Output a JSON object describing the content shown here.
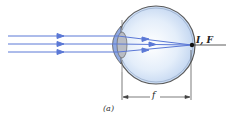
{
  "diagram": {
    "type": "eye-optics",
    "focus_label": "I, F",
    "focal_length_label": "f",
    "caption": "(a)",
    "ray_count": 3,
    "colors": {
      "ray": "#5b78d6",
      "eye_fill": "#cfe0f5",
      "eye_outline": "#555555",
      "lens": "#b8bcc4"
    }
  }
}
